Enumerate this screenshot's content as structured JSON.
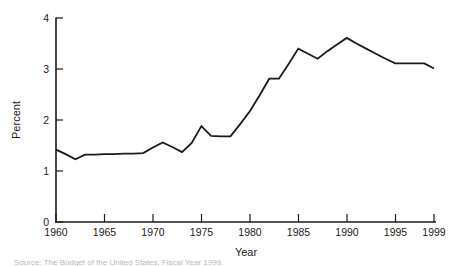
{
  "chart_data": {
    "type": "line",
    "title": "",
    "xlabel": "Year",
    "ylabel": "Percent",
    "xlim": [
      1960,
      1999
    ],
    "ylim": [
      0,
      4
    ],
    "grid": false,
    "legend": null,
    "xticks": [
      1960,
      1965,
      1970,
      1975,
      1980,
      1985,
      1990,
      1995,
      1999
    ],
    "xtick_labels": [
      "1960",
      "1965",
      "1970",
      "1975",
      "1980",
      "1985",
      "1990",
      "1995",
      "1999"
    ],
    "yticks": [
      0,
      1,
      2,
      3,
      4
    ],
    "ytick_labels": [
      "0",
      "1",
      "2",
      "3",
      "4"
    ],
    "x": [
      1960,
      1961,
      1962,
      1963,
      1964,
      1965,
      1966,
      1967,
      1968,
      1969,
      1970,
      1971,
      1972,
      1973,
      1974,
      1975,
      1976,
      1977,
      1978,
      1979,
      1980,
      1981,
      1982,
      1983,
      1984,
      1985,
      1986,
      1987,
      1988,
      1989,
      1990,
      1991,
      1992,
      1993,
      1994,
      1995,
      1996,
      1997,
      1998,
      1999
    ],
    "values": [
      1.42,
      1.33,
      1.23,
      1.32,
      1.32,
      1.33,
      1.33,
      1.34,
      1.34,
      1.35,
      1.46,
      1.56,
      1.47,
      1.37,
      1.55,
      1.88,
      1.69,
      1.68,
      1.68,
      1.92,
      2.17,
      2.48,
      2.81,
      2.81,
      3.1,
      3.4,
      3.3,
      3.2,
      3.35,
      3.48,
      3.61,
      3.5,
      3.4,
      3.3,
      3.2,
      3.11,
      3.11,
      3.11,
      3.11,
      3.01
    ],
    "series_name": "Net interest as percent of GDP",
    "caption": "Source:  The Budget of the United States, Fiscal Year 1999."
  },
  "labels": {
    "x_axis_title": "Year",
    "y_axis_title": "Percent"
  }
}
